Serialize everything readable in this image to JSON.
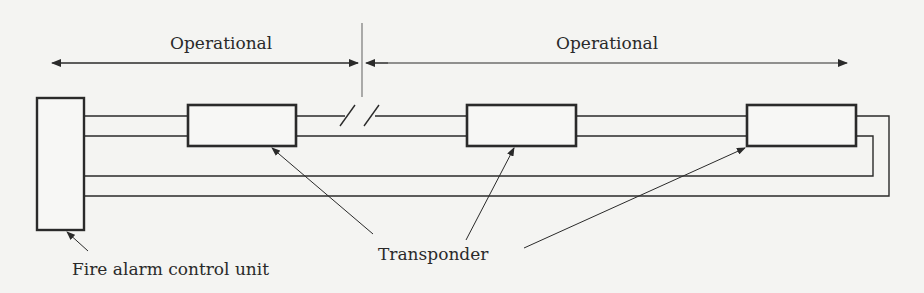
{
  "diagram": {
    "type": "Class A fire alarm loop wiring with transponders",
    "sections": [
      {
        "label": "Operational",
        "side": "left"
      },
      {
        "label": "Operational",
        "side": "right"
      }
    ],
    "nodes": {
      "control_unit": {
        "label": "Fire alarm control unit"
      },
      "transponder": {
        "label": "Transponder",
        "count": 3
      }
    },
    "break_symbol": "//",
    "colors": {
      "line": "#2a2a2a",
      "background": "#f4f4f2",
      "divider": "#777777"
    }
  }
}
